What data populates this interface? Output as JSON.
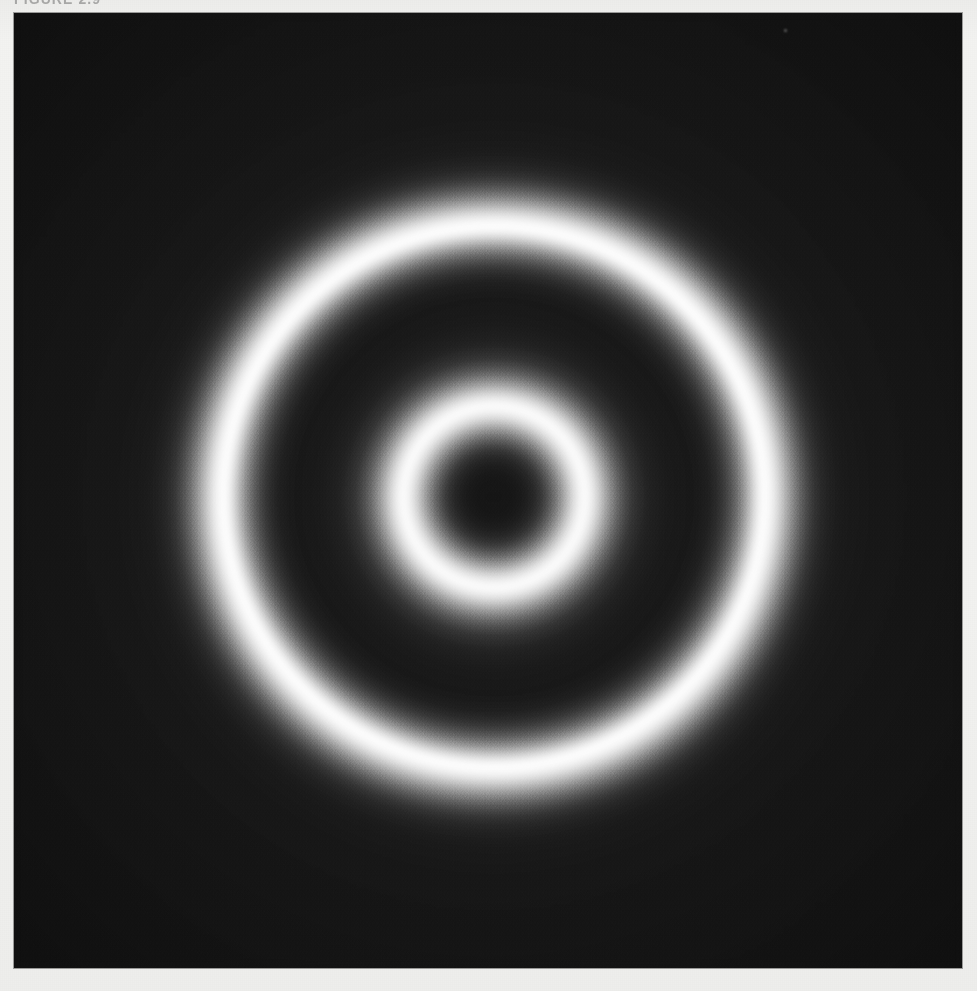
{
  "document": {
    "page_background_color": "#f1f1ef",
    "caption": "FIGURE 2.9"
  },
  "figure": {
    "name": "concentric-ring-diffraction-pattern",
    "panel": {
      "x": 14,
      "y": 13,
      "width": 948,
      "height": 955,
      "background_color": "#161616",
      "border_color": "#000000"
    },
    "artifact_label": "dust-speck"
  },
  "chart_data": {
    "type": "heatmap",
    "title": "FIGURE 2.9",
    "subtitle": "",
    "xlabel": "",
    "ylabel": "",
    "colormap": "grayscale",
    "value_range": [
      0,
      255
    ],
    "background_level": 22,
    "peak_level": 255,
    "center": {
      "x": 494,
      "y": 497
    },
    "units": "pixels",
    "radial_profile": {
      "radius": [
        0,
        18,
        34,
        48,
        60,
        70,
        79,
        86,
        90,
        95,
        102,
        112,
        124,
        138,
        155,
        175,
        198,
        216,
        230,
        241,
        250,
        257,
        263,
        267,
        270,
        274,
        280,
        287,
        296,
        306,
        318,
        332,
        350,
        380,
        430,
        470
      ],
      "intensity": [
        21,
        22,
        29,
        46,
        86,
        142,
        207,
        242,
        255,
        244,
        210,
        147,
        89,
        51,
        33,
        26,
        24,
        27,
        35,
        58,
        106,
        168,
        222,
        251,
        255,
        250,
        226,
        180,
        124,
        77,
        46,
        33,
        26,
        23,
        22,
        21
      ]
    },
    "features": [
      {
        "name": "central-dark-core",
        "radius": 0,
        "radius_outer": 40,
        "peak_intensity": 22,
        "type": "minimum"
      },
      {
        "name": "inner-bright-ring",
        "radius": 88,
        "fwhm": 26,
        "peak_intensity": 255,
        "type": "maximum"
      },
      {
        "name": "first-dark-annulus",
        "radius": 180,
        "radius_outer": 215,
        "peak_intensity": 24,
        "type": "minimum"
      },
      {
        "name": "outer-bright-ring",
        "radius": 268,
        "fwhm": 42,
        "peak_intensity": 255,
        "type": "maximum"
      },
      {
        "name": "outer-dark-field",
        "radius": 360,
        "radius_outer": 470,
        "peak_intensity": 21,
        "type": "minimum"
      }
    ],
    "grid": false,
    "legend": false,
    "axes_visible": false
  }
}
